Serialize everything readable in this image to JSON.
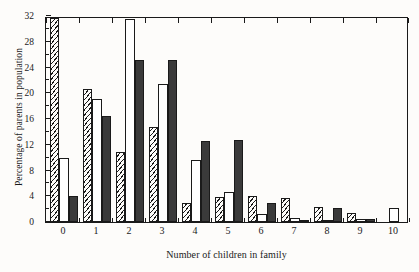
{
  "chart_data": {
    "type": "bar",
    "title": "",
    "xlabel": "Number of children in family",
    "ylabel": "Percentage of parents in population",
    "categories": [
      "0",
      "1",
      "2",
      "3",
      "4",
      "5",
      "6",
      "7",
      "8",
      "9",
      "10"
    ],
    "ylim": [
      0,
      32
    ],
    "ytick_labels": [
      "0",
      "4",
      "8",
      "12",
      "16",
      "20",
      "24",
      "28",
      "32"
    ],
    "ytick_values": [
      0,
      4,
      8,
      12,
      16,
      20,
      24,
      28,
      32
    ],
    "yminor_step": 2,
    "grid": false,
    "legend": "none",
    "series": [
      {
        "name": "series-1",
        "style": "hatched",
        "values": [
          31.7,
          20.7,
          10.9,
          14.7,
          3.0,
          3.9,
          4.1,
          3.7,
          2.4,
          1.4,
          0.0
        ]
      },
      {
        "name": "series-2",
        "style": "white",
        "values": [
          9.9,
          19.1,
          31.6,
          21.4,
          9.7,
          4.6,
          1.2,
          0.7,
          0.3,
          0.5,
          2.2
        ]
      },
      {
        "name": "series-3",
        "style": "black",
        "values": [
          4.0,
          16.4,
          25.1,
          25.1,
          12.6,
          12.7,
          2.9,
          0.2,
          2.2,
          0.4,
          0.0
        ]
      }
    ]
  }
}
